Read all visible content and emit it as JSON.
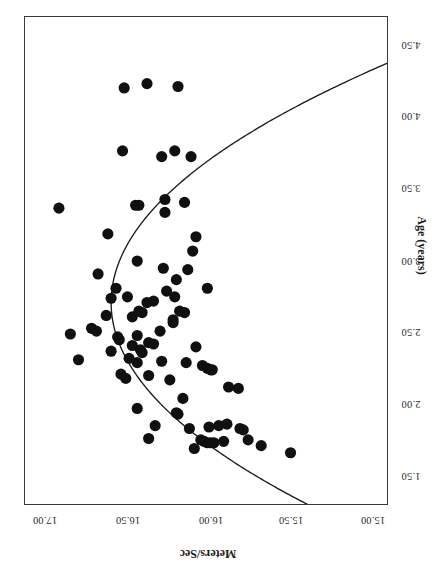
{
  "chart_data": {
    "type": "scatter",
    "title": "",
    "orientation": "rotated-90-counterclockwise",
    "xlabel": "Meters/Sec",
    "ylabel": "Age (years)",
    "x_ticks": [
      "17.00",
      "16.50",
      "16.00",
      "15.50",
      "15.00"
    ],
    "x_tick_values": [
      17.0,
      16.5,
      16.0,
      15.5,
      15.0
    ],
    "y_ticks": [
      "4.50",
      "4.00",
      "3.50",
      "3.00",
      "2.50",
      "2.00",
      "1.50"
    ],
    "y_tick_values": [
      4.5,
      4.0,
      3.5,
      3.0,
      2.5,
      2.0,
      1.5
    ],
    "xlim": [
      17.16,
      14.85
    ],
    "ylim": [
      4.72,
      1.3
    ],
    "grid": false,
    "legend": null,
    "marker": {
      "shape": "circle",
      "color": "#101010",
      "size": 5.6
    },
    "series": [
      {
        "name": "observations",
        "x_label": "Meters/Sec",
        "y_label": "Age (years)",
        "points": [
          [
            16.92,
            3.38
          ],
          [
            16.52,
            4.22
          ],
          [
            16.38,
            4.25
          ],
          [
            16.19,
            4.23
          ],
          [
            16.53,
            3.78
          ],
          [
            16.29,
            3.74
          ],
          [
            16.21,
            3.78
          ],
          [
            16.11,
            3.74
          ],
          [
            16.45,
            3.4
          ],
          [
            16.43,
            3.4
          ],
          [
            16.27,
            3.44
          ],
          [
            16.27,
            3.35
          ],
          [
            16.15,
            3.42
          ],
          [
            16.62,
            3.2
          ],
          [
            16.44,
            3.01
          ],
          [
            16.68,
            2.92
          ],
          [
            16.28,
            2.96
          ],
          [
            16.1,
            3.08
          ],
          [
            16.2,
            2.88
          ],
          [
            16.13,
            2.95
          ],
          [
            16.57,
            2.82
          ],
          [
            16.08,
            3.18
          ],
          [
            16.26,
            2.8
          ],
          [
            16.21,
            2.76
          ],
          [
            16.5,
            2.76
          ],
          [
            16.34,
            2.73
          ],
          [
            16.38,
            2.72
          ],
          [
            16.01,
            2.82
          ],
          [
            16.63,
            2.63
          ],
          [
            16.41,
            2.65
          ],
          [
            16.43,
            2.66
          ],
          [
            16.47,
            2.62
          ],
          [
            16.72,
            2.54
          ],
          [
            16.69,
            2.52
          ],
          [
            16.85,
            2.5
          ],
          [
            16.56,
            2.48
          ],
          [
            16.55,
            2.46
          ],
          [
            16.44,
            2.49
          ],
          [
            16.22,
            2.6
          ],
          [
            16.22,
            2.58
          ],
          [
            16.37,
            2.44
          ],
          [
            16.47,
            2.42
          ],
          [
            16.42,
            2.39
          ],
          [
            16.41,
            2.37
          ],
          [
            16.34,
            2.43
          ],
          [
            16.08,
            2.41
          ],
          [
            16.8,
            2.32
          ],
          [
            16.49,
            2.33
          ],
          [
            16.44,
            2.3
          ],
          [
            16.29,
            2.31
          ],
          [
            16.14,
            2.3
          ],
          [
            16.04,
            2.28
          ],
          [
            16.01,
            2.26
          ],
          [
            15.99,
            2.25
          ],
          [
            15.98,
            2.25
          ],
          [
            16.54,
            2.22
          ],
          [
            16.51,
            2.19
          ],
          [
            16.37,
            2.21
          ],
          [
            15.88,
            2.13
          ],
          [
            15.82,
            2.12
          ],
          [
            16.44,
            1.98
          ],
          [
            16.2,
            1.95
          ],
          [
            16.19,
            1.94
          ],
          [
            16.33,
            1.86
          ],
          [
            16.12,
            1.84
          ],
          [
            16.0,
            1.85
          ],
          [
            15.94,
            1.86
          ],
          [
            15.89,
            1.87
          ],
          [
            15.81,
            1.84
          ],
          [
            15.79,
            1.83
          ],
          [
            16.37,
            1.77
          ],
          [
            16.05,
            1.76
          ],
          [
            16.03,
            1.75
          ],
          [
            16.01,
            1.74
          ],
          [
            15.99,
            1.74
          ],
          [
            15.97,
            1.74
          ],
          [
            15.91,
            1.75
          ],
          [
            15.76,
            1.76
          ],
          [
            16.09,
            1.7
          ],
          [
            15.68,
            1.72
          ],
          [
            15.5,
            1.67
          ],
          [
            16.16,
            2.05
          ],
          [
            16.3,
            2.52
          ],
          [
            16.6,
            2.38
          ],
          [
            16.24,
            2.18
          ],
          [
            16.6,
            2.75
          ],
          [
            16.18,
            2.66
          ],
          [
            16.15,
            2.65
          ]
        ]
      }
    ],
    "fit_curve": {
      "name": "quadratic fit",
      "type": "quadratic",
      "vertex": [
        16.6,
        2.72
      ],
      "description": "Inverted parabola fitted to Age vs Meters/Sec; speed peaks near age 2.7 years"
    }
  },
  "axes": {
    "ms": {
      "title": "Meters/Sec",
      "ticks": [
        {
          "label": "17.00",
          "pos": 45
        },
        {
          "label": "16.50",
          "pos": 128
        },
        {
          "label": "16.00",
          "pos": 211
        },
        {
          "label": "15.50",
          "pos": 291
        },
        {
          "label": "15.00",
          "pos": 373
        }
      ]
    },
    "age": {
      "title": "Age (years)",
      "ticks": [
        {
          "label": "4.50",
          "pos": 47
        },
        {
          "label": "4.00",
          "pos": 118
        },
        {
          "label": "3.50",
          "pos": 190
        },
        {
          "label": "3.00",
          "pos": 263
        },
        {
          "label": "2.50",
          "pos": 334
        },
        {
          "label": "2.00",
          "pos": 406
        },
        {
          "label": "1.50",
          "pos": 478
        }
      ]
    }
  },
  "colors": {
    "marker": "#101010",
    "curve": "#1b1b1b",
    "frame": "#3a3a3a",
    "background": "#ffffff",
    "text": "#2b2b2b"
  }
}
